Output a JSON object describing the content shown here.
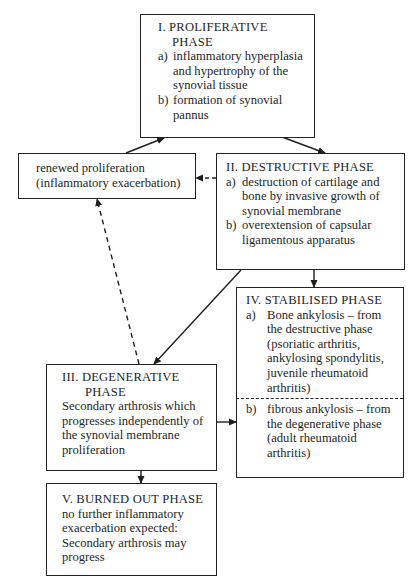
{
  "diagram": {
    "nodes": {
      "proliferative": {
        "title_line1": "I. PROLIFERATIVE",
        "title_line2": "PHASE",
        "items": [
          {
            "label": "a)",
            "text": "inflammatory hyperplasia and hypertrophy of the synovial tissue"
          },
          {
            "label": "b)",
            "text": "formation of synovial pannus"
          }
        ]
      },
      "renewed": {
        "line1": "renewed proliferation",
        "line2": "(inflammatory exacerbation)"
      },
      "destructive": {
        "title": "II. DESTRUCTIVE PHASE",
        "items": [
          {
            "label": "a)",
            "text": "destruction of cartilage and bone by invasive growth of synovial membrane"
          },
          {
            "label": "b)",
            "text": "overextension of capsular ligamentous apparatus"
          }
        ]
      },
      "stabilised": {
        "title": "IV. STABILISED PHASE",
        "items": [
          {
            "label": "a)",
            "text": "Bone ankylosis – from the destructive phase (psoriatic arthritis, ankylosing spondylitis, juvenile rheumatoid arthritis)"
          },
          {
            "label": "b)",
            "text": "fibrous ankylosis – from the degenerative phase (adult rheumatoid arthritis)"
          }
        ]
      },
      "degenerative": {
        "title_line1": "III. DEGENERATIVE",
        "title_line2": "PHASE",
        "text": "Secondary arthrosis which progresses independently of the synovial membrane proliferation"
      },
      "burned_out": {
        "title": "V. BURNED OUT PHASE",
        "text": "no further inflammatory exacerbation expected: Secondary arthrosis may progress"
      }
    },
    "edges": [
      {
        "from": "proliferative",
        "to": "destructive",
        "style": "solid"
      },
      {
        "from": "renewed",
        "to": "proliferative",
        "style": "solid"
      },
      {
        "from": "destructive",
        "to": "renewed",
        "style": "dashed"
      },
      {
        "from": "destructive",
        "to": "stabilised",
        "style": "solid"
      },
      {
        "from": "destructive",
        "to": "degenerative",
        "style": "solid"
      },
      {
        "from": "degenerative",
        "to": "renewed",
        "style": "dashed"
      },
      {
        "from": "degenerative",
        "to": "stabilised",
        "style": "solid"
      },
      {
        "from": "degenerative",
        "to": "burned_out",
        "style": "solid"
      }
    ]
  }
}
